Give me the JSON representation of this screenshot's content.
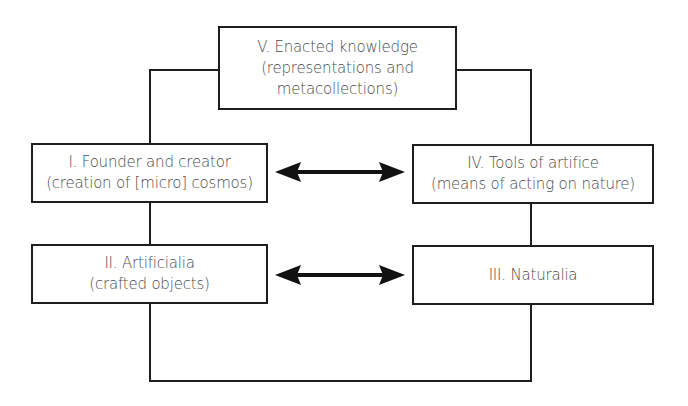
{
  "diagram": {
    "nodes": [
      {
        "id": "V",
        "lines": [
          "V. Enacted knowledge",
          "(representations and",
          "metacollections)"
        ]
      },
      {
        "id": "I",
        "lines": [
          "I. Founder and creator",
          "(creation of [micro] cosmos)"
        ]
      },
      {
        "id": "IV",
        "lines": [
          "IV. Tools of artifice",
          "(means of acting on nature)"
        ]
      },
      {
        "id": "II",
        "lines": [
          "II. Artificialia",
          "(crafted objects)"
        ]
      },
      {
        "id": "III",
        "lines": [
          "III. Naturalia"
        ]
      }
    ],
    "edges": [
      {
        "from": "V",
        "to": "I",
        "type": "line"
      },
      {
        "from": "V",
        "to": "IV",
        "type": "line"
      },
      {
        "from": "I",
        "to": "II",
        "type": "line"
      },
      {
        "from": "IV",
        "to": "III",
        "type": "line"
      },
      {
        "from": "II",
        "to": "III",
        "type": "line",
        "route": "bottom"
      },
      {
        "from": "I",
        "to": "IV",
        "type": "double-arrow"
      },
      {
        "from": "II",
        "to": "III",
        "type": "double-arrow"
      }
    ],
    "colors": {
      "stroke": "#1e1e1e",
      "text": "#4a4a4a",
      "background": "#ffffff"
    }
  }
}
